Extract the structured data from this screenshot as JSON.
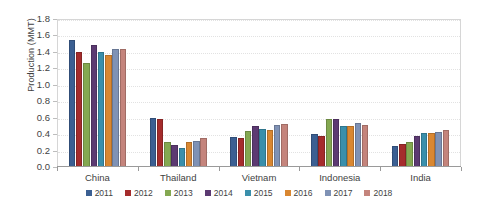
{
  "chart_data": {
    "type": "bar",
    "title": "",
    "subtitle": "",
    "xlabel": "",
    "ylabel": "Production (MMT)",
    "ylim": [
      0.0,
      1.8
    ],
    "ytick_labels": [
      "1.8",
      "1.6",
      "1.4",
      "1.2",
      "1.0",
      "0.8",
      "0.6",
      "0.4",
      "0.2",
      "0.0"
    ],
    "ytick_values": [
      1.8,
      1.6,
      1.4,
      1.2,
      1.0,
      0.8,
      0.6,
      0.4,
      0.2,
      0.0
    ],
    "grid": true,
    "legend_position": "bottom",
    "categories": [
      "China",
      "Thailand",
      "Vietnam",
      "Indonesia",
      "India"
    ],
    "series": [
      {
        "name": "2011",
        "color": "#3b5f92",
        "values": [
          1.55,
          0.6,
          0.37,
          0.4,
          0.25
        ]
      },
      {
        "name": "2012",
        "color": "#a52c2c",
        "values": [
          1.4,
          0.59,
          0.35,
          0.38,
          0.28
        ]
      },
      {
        "name": "2013",
        "color": "#84a851",
        "values": [
          1.26,
          0.31,
          0.44,
          0.58,
          0.31
        ]
      },
      {
        "name": "2014",
        "color": "#5c3a72",
        "values": [
          1.48,
          0.27,
          0.5,
          0.59,
          0.38
        ]
      },
      {
        "name": "2015",
        "color": "#3a8fab",
        "values": [
          1.4,
          0.23,
          0.46,
          0.5,
          0.41
        ]
      },
      {
        "name": "2016",
        "color": "#d98731",
        "values": [
          1.36,
          0.3,
          0.45,
          0.5,
          0.41
        ]
      },
      {
        "name": "2017",
        "color": "#7f92b5",
        "values": [
          1.43,
          0.32,
          0.51,
          0.53,
          0.43
        ]
      },
      {
        "name": "2018",
        "color": "#c4847c",
        "values": [
          1.44,
          0.35,
          0.52,
          0.51,
          0.45
        ]
      }
    ]
  },
  "legend": {
    "items": [
      {
        "label": "2011"
      },
      {
        "label": "2012"
      },
      {
        "label": "2013"
      },
      {
        "label": "2014"
      },
      {
        "label": "2015"
      },
      {
        "label": "2016"
      },
      {
        "label": "2017"
      },
      {
        "label": "2018"
      }
    ]
  }
}
